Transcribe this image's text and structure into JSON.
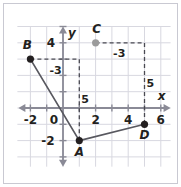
{
  "figure": {
    "type": "coordinate-grid-diagram",
    "axes": {
      "x_label": "x",
      "y_label": "y",
      "origin_label": "0",
      "x_ticks": [
        "-2",
        "2",
        "4",
        "6"
      ],
      "y_ticks": [
        "4",
        "-2"
      ],
      "x_range": [
        -2.8,
        6.6
      ],
      "y_range": [
        -3.6,
        5.0
      ],
      "grid": true
    },
    "colors": {
      "grid": "#d8d8e0",
      "axis": "#8a8a96",
      "point_dark": "#231f20",
      "point_gray": "#9b9b9b",
      "segment": "#58585f",
      "dashed": "#4a4a52",
      "text": "#231f20",
      "frame": "#c9c9d2",
      "background": "#ffffff"
    },
    "points": [
      {
        "name": "A",
        "x": 1,
        "y": -2,
        "fill": "dark",
        "label_dx": 0,
        "label_dy": 15
      },
      {
        "name": "B",
        "x": -2,
        "y": 3,
        "fill": "dark",
        "label_dx": -3,
        "label_dy": -10
      },
      {
        "name": "C",
        "x": 2,
        "y": 4,
        "fill": "gray",
        "label_dx": 1,
        "label_dy": -10
      },
      {
        "name": "D",
        "x": 5,
        "y": -1,
        "fill": "dark",
        "label_dx": 0,
        "label_dy": 15
      }
    ],
    "segments": [
      {
        "from": "B",
        "to": "A"
      },
      {
        "from": "A",
        "to": "D"
      }
    ],
    "dashed_paths": [
      {
        "id": "from-B",
        "points": [
          [
            -2,
            3
          ],
          [
            1,
            3
          ],
          [
            1,
            -2
          ]
        ],
        "leg_labels": [
          {
            "text": "-3",
            "x": -0.45,
            "y": 2.35
          },
          {
            "text": "5",
            "x": 1.35,
            "y": 0.55
          }
        ]
      },
      {
        "id": "from-C",
        "points": [
          [
            2,
            4
          ],
          [
            5,
            4
          ],
          [
            5,
            -1
          ]
        ],
        "leg_labels": [
          {
            "text": "-3",
            "x": 3.45,
            "y": 3.35
          },
          {
            "text": "5",
            "x": 5.35,
            "y": 1.55
          }
        ]
      }
    ]
  }
}
